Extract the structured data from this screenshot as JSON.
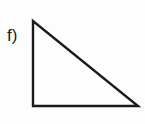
{
  "figure": {
    "label": "f)"
  },
  "triangle": {
    "type": "right-triangle",
    "vertices": [
      {
        "name": "apex-top-left",
        "x": 33,
        "y": 21
      },
      {
        "name": "right-angle-bottom-left",
        "x": 33,
        "y": 106
      },
      {
        "name": "bottom-right",
        "x": 138,
        "y": 106
      }
    ],
    "points_attr": "33,21 33,106 138,106",
    "stroke_color": "#1a1a1a",
    "fill": "none"
  },
  "colors": {
    "background": "#fdfdfd",
    "line": "#1a1a1a",
    "text": "#1a1a1a"
  }
}
